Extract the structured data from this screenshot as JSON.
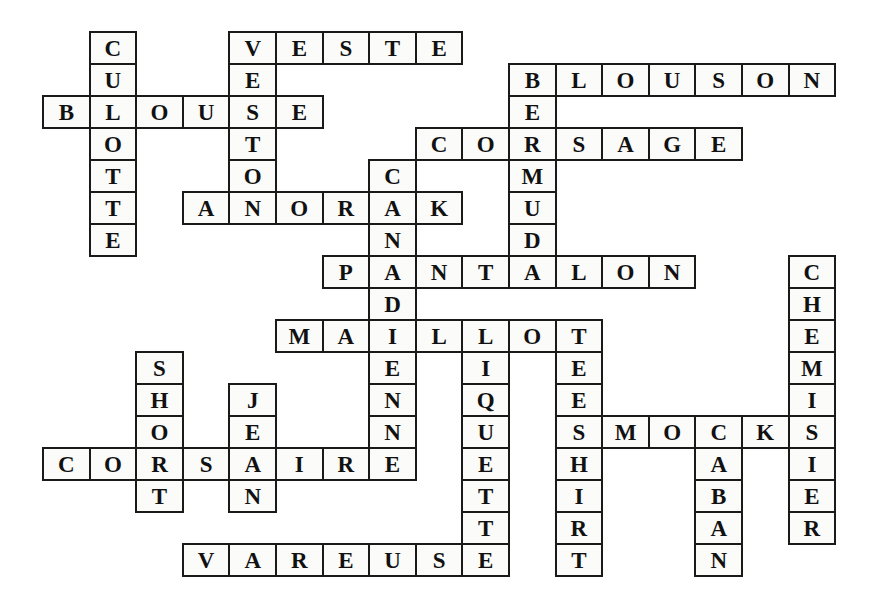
{
  "puzzle": {
    "title": "Crossword grid of French clothing words",
    "type": "crossword-grid",
    "grid": {
      "origin_x": 42,
      "origin_y": 31,
      "cell_w": 46.6,
      "cell_h": 32.0,
      "cols": 18,
      "rows": 17
    },
    "colors": {
      "cell_fill": "#fbfbfa",
      "cell_border": "#1a1a1a",
      "letter": "#111111",
      "background": "#ffffff"
    },
    "entries": [
      {
        "word": "CULOTTE",
        "direction": "down",
        "row": 0,
        "col": 1
      },
      {
        "word": "VESTE",
        "direction": "across",
        "row": 0,
        "col": 4
      },
      {
        "word": "VESTON",
        "direction": "down",
        "row": 0,
        "col": 4
      },
      {
        "word": "BLOUSON",
        "direction": "across",
        "row": 1,
        "col": 10
      },
      {
        "word": "BLOUSE",
        "direction": "across",
        "row": 2,
        "col": 0
      },
      {
        "word": "BERMUDA",
        "direction": "down",
        "row": 1,
        "col": 10
      },
      {
        "word": "CORSAGE",
        "direction": "across",
        "row": 3,
        "col": 8
      },
      {
        "word": "CANADIENNE",
        "direction": "down",
        "row": 4,
        "col": 7
      },
      {
        "word": "ANORAK",
        "direction": "across",
        "row": 5,
        "col": 3
      },
      {
        "word": "PANTALON",
        "direction": "across",
        "row": 7,
        "col": 6
      },
      {
        "word": "CHEMISIER",
        "direction": "down",
        "row": 7,
        "col": 16
      },
      {
        "width_note": "MAILLOT row",
        "word": "MAILLOT",
        "direction": "across",
        "row": 9,
        "col": 5
      },
      {
        "word": "LIQUETTE",
        "direction": "down",
        "row": 9,
        "col": 9
      },
      {
        "word": "TEE-SHIRT",
        "direction": "down",
        "row": 9,
        "col": 11
      },
      {
        "word": "SHORT",
        "direction": "down",
        "row": 10,
        "col": 2
      },
      {
        "word": "JEAN",
        "direction": "down",
        "row": 11,
        "col": 4
      },
      {
        "word": "SMOCKS",
        "direction": "across",
        "row": 12,
        "col": 11
      },
      {
        "word": "CORSAIRE",
        "direction": "across",
        "row": 13,
        "col": 0
      },
      {
        "word": "CABAN",
        "direction": "down",
        "row": 12,
        "col": 14
      },
      {
        "word": "VAREUSE",
        "direction": "across",
        "row": 16,
        "col": 3
      }
    ],
    "cells": [
      {
        "r": 0,
        "c": 1,
        "l": "C"
      },
      {
        "r": 0,
        "c": 4,
        "l": "V"
      },
      {
        "r": 0,
        "c": 5,
        "l": "E"
      },
      {
        "r": 0,
        "c": 6,
        "l": "S"
      },
      {
        "r": 0,
        "c": 7,
        "l": "T"
      },
      {
        "r": 0,
        "c": 8,
        "l": "E"
      },
      {
        "r": 1,
        "c": 1,
        "l": "U"
      },
      {
        "r": 1,
        "c": 4,
        "l": "E"
      },
      {
        "r": 1,
        "c": 10,
        "l": "B"
      },
      {
        "r": 1,
        "c": 11,
        "l": "L"
      },
      {
        "r": 1,
        "c": 12,
        "l": "O"
      },
      {
        "r": 1,
        "c": 13,
        "l": "U"
      },
      {
        "r": 1,
        "c": 14,
        "l": "S"
      },
      {
        "r": 1,
        "c": 15,
        "l": "O"
      },
      {
        "r": 1,
        "c": 16,
        "l": "N"
      },
      {
        "r": 2,
        "c": 0,
        "l": "B"
      },
      {
        "r": 2,
        "c": 1,
        "l": "L"
      },
      {
        "r": 2,
        "c": 2,
        "l": "O"
      },
      {
        "r": 2,
        "c": 3,
        "l": "U"
      },
      {
        "r": 2,
        "c": 4,
        "l": "S"
      },
      {
        "r": 2,
        "c": 5,
        "l": "E"
      },
      {
        "r": 2,
        "c": 10,
        "l": "E"
      },
      {
        "r": 3,
        "c": 1,
        "l": "O"
      },
      {
        "r": 3,
        "c": 4,
        "l": "T"
      },
      {
        "r": 3,
        "c": 8,
        "l": "C"
      },
      {
        "r": 3,
        "c": 9,
        "l": "O"
      },
      {
        "r": 3,
        "c": 10,
        "l": "R"
      },
      {
        "r": 3,
        "c": 11,
        "l": "S"
      },
      {
        "r": 3,
        "c": 12,
        "l": "A"
      },
      {
        "r": 3,
        "c": 13,
        "l": "G"
      },
      {
        "r": 3,
        "c": 14,
        "l": "E"
      },
      {
        "r": 4,
        "c": 1,
        "l": "T"
      },
      {
        "r": 4,
        "c": 4,
        "l": "O"
      },
      {
        "r": 4,
        "c": 7,
        "l": "C"
      },
      {
        "r": 4,
        "c": 10,
        "l": "M"
      },
      {
        "r": 5,
        "c": 1,
        "l": "T"
      },
      {
        "r": 5,
        "c": 3,
        "l": "A"
      },
      {
        "r": 5,
        "c": 4,
        "l": "N"
      },
      {
        "r": 5,
        "c": 5,
        "l": "O"
      },
      {
        "r": 5,
        "c": 6,
        "l": "R"
      },
      {
        "r": 5,
        "c": 7,
        "l": "A"
      },
      {
        "r": 5,
        "c": 8,
        "l": "K"
      },
      {
        "r": 5,
        "c": 10,
        "l": "U"
      },
      {
        "r": 6,
        "c": 1,
        "l": "E"
      },
      {
        "r": 6,
        "c": 7,
        "l": "N"
      },
      {
        "r": 6,
        "c": 10,
        "l": "D"
      },
      {
        "r": 7,
        "c": 6,
        "l": "P"
      },
      {
        "r": 7,
        "c": 7,
        "l": "A"
      },
      {
        "r": 7,
        "c": 8,
        "l": "N"
      },
      {
        "r": 7,
        "c": 9,
        "l": "T"
      },
      {
        "r": 7,
        "c": 10,
        "l": "A"
      },
      {
        "r": 7,
        "c": 11,
        "l": "L"
      },
      {
        "r": 7,
        "c": 12,
        "l": "O"
      },
      {
        "r": 7,
        "c": 13,
        "l": "N"
      },
      {
        "r": 7,
        "c": 16,
        "l": "C"
      },
      {
        "r": 8,
        "c": 7,
        "l": "D"
      },
      {
        "r": 8,
        "c": 16,
        "l": "H"
      },
      {
        "r": 9,
        "c": 5,
        "l": "M"
      },
      {
        "r": 9,
        "c": 6,
        "l": "A"
      },
      {
        "r": 9,
        "c": 7,
        "l": "I"
      },
      {
        "r": 9,
        "c": 8,
        "l": "L"
      },
      {
        "r": 9,
        "c": 9,
        "l": "L"
      },
      {
        "r": 9,
        "c": 10,
        "l": "O"
      },
      {
        "r": 9,
        "c": 11,
        "l": "T"
      },
      {
        "r": 9,
        "c": 16,
        "l": "E"
      },
      {
        "r": 10,
        "c": 2,
        "l": "S"
      },
      {
        "r": 10,
        "c": 7,
        "l": "E"
      },
      {
        "r": 10,
        "c": 9,
        "l": "I"
      },
      {
        "r": 10,
        "c": 11,
        "l": "E"
      },
      {
        "r": 10,
        "c": 16,
        "l": "M"
      },
      {
        "r": 11,
        "c": 2,
        "l": "H"
      },
      {
        "r": 11,
        "c": 4,
        "l": "J"
      },
      {
        "r": 11,
        "c": 7,
        "l": "N"
      },
      {
        "r": 11,
        "c": 9,
        "l": "Q"
      },
      {
        "r": 11,
        "c": 11,
        "l": "E"
      },
      {
        "r": 11,
        "c": 16,
        "l": "I"
      },
      {
        "r": 12,
        "c": 2,
        "l": "O"
      },
      {
        "r": 12,
        "c": 4,
        "l": "E"
      },
      {
        "r": 12,
        "c": 7,
        "l": "N"
      },
      {
        "r": 12,
        "c": 9,
        "l": "U"
      },
      {
        "r": 12,
        "c": 11,
        "l": "S"
      },
      {
        "r": 12,
        "c": 12,
        "l": "M"
      },
      {
        "r": 12,
        "c": 13,
        "l": "O"
      },
      {
        "r": 12,
        "c": 14,
        "l": "C"
      },
      {
        "r": 12,
        "c": 15,
        "l": "K"
      },
      {
        "r": 12,
        "c": 16,
        "l": "S"
      },
      {
        "r": 13,
        "c": 0,
        "l": "C"
      },
      {
        "r": 13,
        "c": 1,
        "l": "O"
      },
      {
        "r": 13,
        "c": 2,
        "l": "R"
      },
      {
        "r": 13,
        "c": 3,
        "l": "S"
      },
      {
        "r": 13,
        "c": 4,
        "l": "A"
      },
      {
        "r": 13,
        "c": 5,
        "l": "I"
      },
      {
        "r": 13,
        "c": 6,
        "l": "R"
      },
      {
        "r": 13,
        "c": 7,
        "l": "E"
      },
      {
        "r": 13,
        "c": 9,
        "l": "E"
      },
      {
        "r": 13,
        "c": 11,
        "l": "H"
      },
      {
        "r": 13,
        "c": 14,
        "l": "A"
      },
      {
        "r": 13,
        "c": 16,
        "l": "I"
      },
      {
        "r": 14,
        "c": 2,
        "l": "T"
      },
      {
        "r": 14,
        "c": 4,
        "l": "N"
      },
      {
        "r": 14,
        "c": 9,
        "l": "T"
      },
      {
        "r": 14,
        "c": 11,
        "l": "I"
      },
      {
        "r": 14,
        "c": 14,
        "l": "B"
      },
      {
        "r": 14,
        "c": 16,
        "l": "E"
      },
      {
        "r": 15,
        "c": 9,
        "l": "T"
      },
      {
        "r": 15,
        "c": 11,
        "l": "R"
      },
      {
        "r": 15,
        "c": 14,
        "l": "A"
      },
      {
        "r": 15,
        "c": 16,
        "l": "R"
      },
      {
        "r": 16,
        "c": 3,
        "l": "V"
      },
      {
        "r": 16,
        "c": 4,
        "l": "A"
      },
      {
        "r": 16,
        "c": 5,
        "l": "R"
      },
      {
        "r": 16,
        "c": 6,
        "l": "E"
      },
      {
        "r": 16,
        "c": 7,
        "l": "U"
      },
      {
        "r": 16,
        "c": 8,
        "l": "S"
      },
      {
        "r": 16,
        "c": 9,
        "l": "E"
      },
      {
        "r": 16,
        "c": 11,
        "l": "T"
      },
      {
        "r": 16,
        "c": 14,
        "l": "N"
      }
    ]
  }
}
